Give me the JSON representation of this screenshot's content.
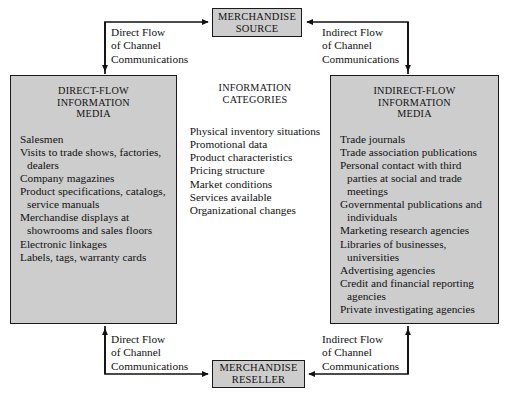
{
  "diagram": {
    "nodes": {
      "source": {
        "line1": "MERCHANDISE",
        "line2": "SOURCE"
      },
      "reseller": {
        "line1": "MERCHANDISE",
        "line2": "RESELLER"
      }
    },
    "left_panel": {
      "head_line1": "DIRECT-FLOW",
      "head_line2": "INFORMATION",
      "head_line3": "MEDIA",
      "items": [
        "Salesmen",
        "Visits to trade shows, factories, dealers",
        "Company magazines",
        "Product specifications, catalogs, service manuals",
        "Merchandise displays at showrooms and sales floors",
        "Electronic linkages",
        "Labels, tags, warranty cards"
      ]
    },
    "center_panel": {
      "head_line1": "INFORMATION",
      "head_line2": "CATEGORIES",
      "items": [
        "Physical inventory situations",
        "Promotional data",
        "Product characteristics",
        "Pricing structure",
        "Market conditions",
        "Services available",
        "Organizational changes"
      ]
    },
    "right_panel": {
      "head_line1": "INDIRECT-FLOW",
      "head_line2": "INFORMATION",
      "head_line3": "MEDIA",
      "items": [
        "Trade journals",
        "Trade association publications",
        "Personal contact with third parties at social and trade meetings",
        "Governmental publications and individuals",
        "Marketing research agencies",
        "Libraries of businesses, universities",
        "Advertising agencies",
        "Credit and financial reporting agencies",
        "Private investigating agencies"
      ]
    },
    "flow_labels": {
      "top_left": "Direct Flow\nof Channel\nCommunications",
      "top_right": "Indirect Flow\nof Channel\nCommunications",
      "bottom_left": "Direct Flow\nof Channel\nCommunications",
      "bottom_right": "Indirect Flow\nof Channel\nCommunications"
    },
    "caption": "",
    "colors": {
      "box_fill": "#cdcdcd",
      "box_border": "#1a1a1a",
      "line": "#111111",
      "background": "#ffffff"
    }
  }
}
